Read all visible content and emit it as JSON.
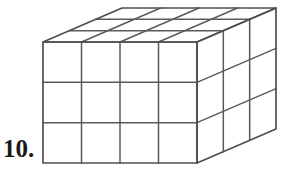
{
  "page": {
    "background_color": "#ffffff",
    "width": 294,
    "height": 173
  },
  "problem": {
    "number_label": "10.",
    "label_color": "#1a1a1a"
  },
  "figure": {
    "name": "rectangular-prism-unit-cubes",
    "line_color": "#4f4f4f",
    "grid_line_color": "#5a5a5a",
    "fill_color": "#ffffff",
    "dimensions": {
      "width_cubes": 4,
      "height_cubes": 3,
      "depth_cubes": 3,
      "total_cubes": 36
    },
    "geometry": {
      "front_left_x": 43,
      "front_top_y": 42,
      "front_right_x": 197,
      "front_bottom_y": 163,
      "depth_dx": 79,
      "depth_dy": -34
    },
    "faces": [
      {
        "name": "front-face",
        "columns": 4,
        "rows": 3
      },
      {
        "name": "top-face",
        "columns": 4,
        "rows": 3
      },
      {
        "name": "right-face",
        "columns": 3,
        "rows": 3
      }
    ]
  }
}
